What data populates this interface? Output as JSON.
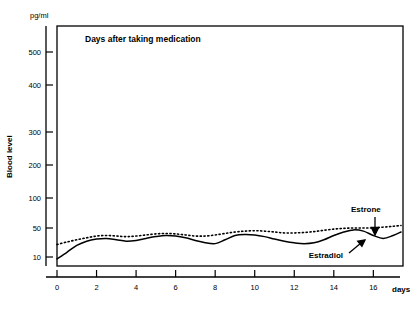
{
  "chart_data": {
    "type": "line",
    "title": "Days after taking medication",
    "xlabel": "days",
    "ylabel": "Blood level",
    "yunit": "pg/ml",
    "grid": false,
    "legend_position": "inline-annotations",
    "xlim": [
      0,
      17.5
    ],
    "x_ticks": [
      "0",
      "2",
      "4",
      "6",
      "8",
      "10",
      "12",
      "14",
      "16"
    ],
    "x_tick_values": [
      0,
      2,
      4,
      6,
      8,
      10,
      12,
      14,
      16
    ],
    "y_ticks": [
      "10",
      "50",
      "100",
      "200",
      "300",
      "400",
      "500"
    ],
    "y_tick_values": [
      10,
      50,
      100,
      200,
      300,
      400,
      500
    ],
    "y_scale_note": "compressed-log-like axis: 10,50,100 then linear 100-500",
    "series": [
      {
        "name": "Estradiol",
        "style": "solid",
        "x": [
          0,
          0.5,
          1,
          1.5,
          2,
          2.5,
          3,
          3.5,
          4,
          4.5,
          5,
          5.5,
          6,
          6.5,
          7,
          7.5,
          8,
          8.5,
          9,
          9.5,
          10,
          10.5,
          11,
          11.5,
          12,
          12.5,
          13,
          13.5,
          14,
          14.5,
          15,
          15.5,
          16,
          16.5,
          17,
          17.4
        ],
        "values": [
          9,
          13,
          19,
          24,
          27,
          28,
          26,
          24,
          25,
          28,
          31,
          33,
          32,
          29,
          25,
          22,
          21,
          26,
          33,
          35,
          34,
          31,
          27,
          24,
          22,
          21,
          22,
          26,
          33,
          40,
          45,
          42,
          33,
          28,
          33,
          40
        ]
      },
      {
        "name": "Estrone",
        "style": "dotted",
        "x": [
          0,
          0.5,
          1,
          1.5,
          2,
          2.5,
          3,
          3.5,
          4,
          4.5,
          5,
          5.5,
          6,
          6.5,
          7,
          7.5,
          8,
          8.5,
          9,
          9.5,
          10,
          10.5,
          11,
          11.5,
          12,
          12.5,
          13,
          13.5,
          14,
          14.5,
          15,
          15.5,
          16,
          16.5,
          17,
          17.4
        ],
        "values": [
          20,
          23,
          26,
          29,
          32,
          33,
          32,
          31,
          32,
          34,
          36,
          37,
          36,
          34,
          32,
          32,
          34,
          37,
          40,
          42,
          43,
          42,
          40,
          38,
          38,
          39,
          41,
          44,
          47,
          49,
          50,
          50,
          50,
          51,
          52,
          53
        ]
      }
    ],
    "annotations": [
      {
        "text": "Estrone",
        "target_series": "Estrone",
        "arrow": "down"
      },
      {
        "text": "Estradiol",
        "target_series": "Estradiol",
        "arrow": "up"
      }
    ],
    "colors": {
      "line": "#000000",
      "background": "#ffffff"
    }
  }
}
